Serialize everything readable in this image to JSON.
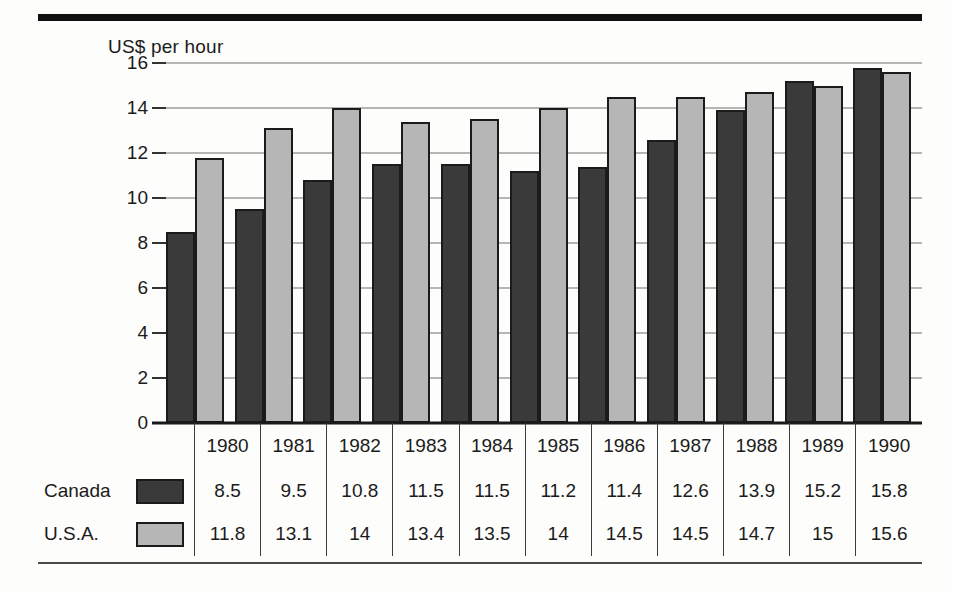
{
  "axis_title": "US$ per hour",
  "legend": [
    {
      "label": "Canada",
      "swatch": "dark-swatch-icon",
      "color": "#3a3a3a"
    },
    {
      "label": "U.S.A.",
      "swatch": "light-swatch-icon",
      "color": "#b6b6b6"
    }
  ],
  "chart_data": {
    "type": "bar",
    "title": "",
    "subtitle": "",
    "xlabel": "",
    "ylabel": "US$ per hour",
    "ylim": [
      0,
      16
    ],
    "yticks": [
      0,
      2,
      4,
      6,
      8,
      10,
      12,
      14,
      16
    ],
    "grid": true,
    "legend_position": "table-left",
    "categories": [
      "1980",
      "1981",
      "1982",
      "1983",
      "1984",
      "1985",
      "1986",
      "1987",
      "1988",
      "1989",
      "1990"
    ],
    "series": [
      {
        "name": "Canada",
        "color": "#3a3a3a",
        "values": [
          8.5,
          9.5,
          10.8,
          11.5,
          11.5,
          11.2,
          11.4,
          12.6,
          13.9,
          15.2,
          15.8
        ]
      },
      {
        "name": "U.S.A.",
        "color": "#b6b6b6",
        "values": [
          11.8,
          13.1,
          14,
          13.4,
          13.5,
          14,
          14.5,
          14.5,
          14.7,
          15,
          15.6
        ]
      }
    ]
  },
  "table": {
    "corner_label": "",
    "row_labels": [
      "Canada",
      "U.S.A."
    ],
    "columns": [
      "1980",
      "1981",
      "1982",
      "1983",
      "1984",
      "1985",
      "1986",
      "1987",
      "1988",
      "1989",
      "1990"
    ],
    "rows": [
      [
        "8.5",
        "9.5",
        "10.8",
        "11.5",
        "11.5",
        "11.2",
        "11.4",
        "12.6",
        "13.9",
        "15.2",
        "15.8"
      ],
      [
        "11.8",
        "13.1",
        "14",
        "13.4",
        "13.5",
        "14",
        "14.5",
        "14.5",
        "14.7",
        "15",
        "15.6"
      ]
    ]
  }
}
